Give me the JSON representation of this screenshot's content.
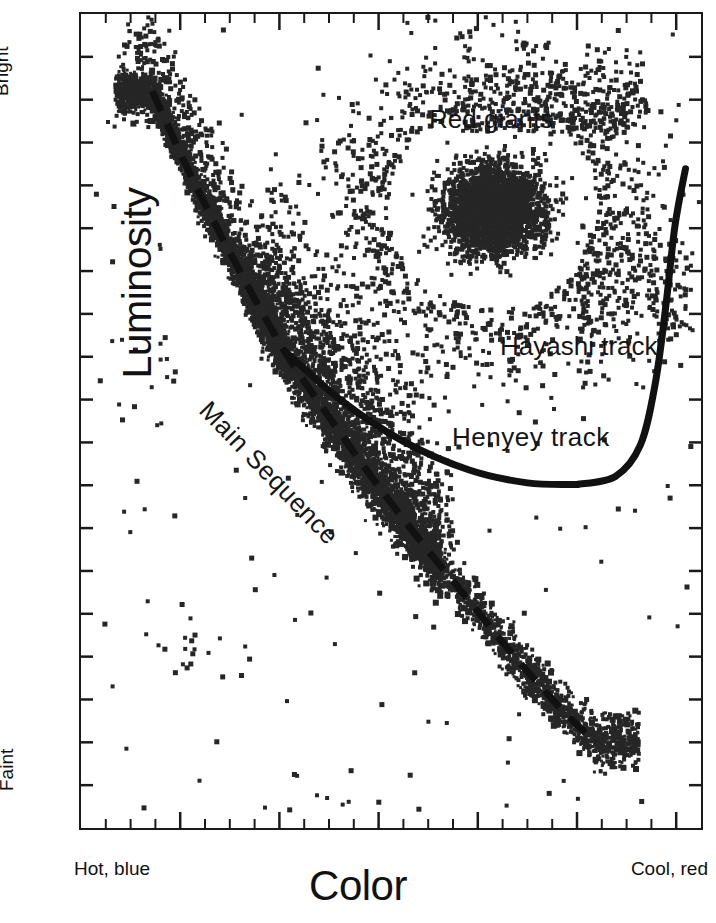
{
  "figure": {
    "axes": {
      "y_title": "Luminosity",
      "y_top_label": "Bright",
      "y_bottom_label": "Faint",
      "x_title": "Color",
      "x_left_label": "Hot, blue",
      "x_right_label": "Cool, red"
    },
    "annotations": {
      "red_giants": "Red giants",
      "hayashi_track": "Hayashi track",
      "henyey_track": "Henyey  track",
      "main_sequence": "Main Sequence"
    }
  },
  "chart_data": {
    "type": "scatter",
    "title": "",
    "subtitle": "",
    "xlabel": "Color",
    "ylabel": "Luminosity",
    "xlabel_low": "Hot, blue",
    "xlabel_high": "Cool, red",
    "ylabel_high": "Bright",
    "ylabel_low": "Faint",
    "grid": false,
    "legend": "none",
    "axis_note": "Unlabeled axes; minor ticks inward on all four sides, major tick every 4th minor tick",
    "xlim": [
      0,
      1
    ],
    "ylim": [
      0,
      1
    ],
    "x_minor_ticks": 25,
    "x_major_every": 4,
    "y_minor_ticks": 19,
    "y_major_every": 1,
    "point_color": "#262626",
    "point_marker": "square",
    "point_size_px": 4,
    "populations": [
      {
        "name": "upper main sequence (hot blue stars)",
        "description": "Dense narrow band descending from top-left",
        "n_points": 2600,
        "x_range": [
          0.04,
          0.3
        ],
        "y_range": [
          0.55,
          0.99
        ],
        "density": "very high"
      },
      {
        "name": "main sequence turnoff / middle band",
        "description": "Broad diagonal band through plot centre",
        "n_points": 3400,
        "x_range": [
          0.26,
          0.56
        ],
        "y_range": [
          0.34,
          0.72
        ],
        "density": "very high"
      },
      {
        "name": "lower main sequence (cool red dwarfs)",
        "description": "Thinning diagonal tail toward bottom-right",
        "n_points": 1500,
        "x_range": [
          0.52,
          0.9
        ],
        "y_range": [
          0.06,
          0.42
        ],
        "density": "moderate"
      },
      {
        "name": "red giant clump",
        "description": "Dense blob in upper-right quadrant",
        "n_points": 2800,
        "x_range": [
          0.52,
          0.88
        ],
        "y_range": [
          0.62,
          0.9
        ],
        "density": "very high"
      },
      {
        "name": "red giant branch / scattered giants",
        "description": "Diffuse halo around the clump extending up and right",
        "n_points": 900,
        "x_range": [
          0.45,
          0.98
        ],
        "y_range": [
          0.58,
          0.99
        ],
        "density": "low"
      },
      {
        "name": "field outliers",
        "description": "Isolated points scattered across empty regions",
        "n_points": 160,
        "x_range": [
          0.02,
          0.99
        ],
        "y_range": [
          0.02,
          0.99
        ],
        "density": "very low"
      }
    ],
    "overlays": [
      {
        "name": "Main Sequence",
        "style": "dashed",
        "color": "#111111",
        "width_px": 7,
        "dash": "22 14",
        "points": [
          [
            0.115,
            0.905
          ],
          [
            0.175,
            0.805
          ],
          [
            0.245,
            0.7
          ],
          [
            0.325,
            0.59
          ],
          [
            0.4,
            0.505
          ],
          [
            0.47,
            0.43
          ],
          [
            0.545,
            0.355
          ],
          [
            0.625,
            0.28
          ],
          [
            0.7,
            0.21
          ],
          [
            0.77,
            0.15
          ],
          [
            0.83,
            0.105
          ]
        ]
      },
      {
        "name": "Henyey track",
        "style": "solid",
        "color": "#111111",
        "width_px": 7,
        "description": "Near-horizontal branch leaving the main sequence turnoff and running right",
        "points": [
          [
            0.33,
            0.585
          ],
          [
            0.42,
            0.525
          ],
          [
            0.52,
            0.475
          ],
          [
            0.625,
            0.44
          ],
          [
            0.72,
            0.424
          ],
          [
            0.8,
            0.422
          ]
        ]
      },
      {
        "name": "Hayashi track",
        "style": "solid",
        "color": "#111111",
        "width_px": 7,
        "description": "Steeply rising near-vertical branch at the cool (right) edge",
        "points": [
          [
            0.8,
            0.422
          ],
          [
            0.862,
            0.432
          ],
          [
            0.902,
            0.47
          ],
          [
            0.926,
            0.545
          ],
          [
            0.943,
            0.64
          ],
          [
            0.958,
            0.74
          ],
          [
            0.975,
            0.81
          ]
        ]
      }
    ],
    "text_annotations": [
      {
        "text": "Red giants",
        "x": 0.58,
        "y": 0.885
      },
      {
        "text": "Hayashi track",
        "x": 0.69,
        "y": 0.605
      },
      {
        "text": "Henyey  track",
        "x": 0.61,
        "y": 0.497
      },
      {
        "text": "Main Sequence",
        "x": 0.25,
        "y": 0.525,
        "rotation": -46
      }
    ]
  }
}
